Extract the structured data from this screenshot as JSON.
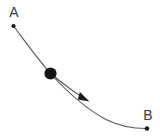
{
  "figure": {
    "name": "brachistochrone-curve-diagram",
    "width": 160,
    "height": 138,
    "background_color": "#ffffff"
  },
  "style": {
    "curve_color": "#555555",
    "curve_width": 1.1,
    "arrow_color": "#1a1a1a",
    "ball_color": "#141414",
    "dot_color": "#141414",
    "label_color": "#3a3a3a",
    "label_font_size": 14
  },
  "labels": [
    {
      "id": "label-a",
      "text": "A",
      "x": 14,
      "y": 17
    },
    {
      "id": "label-b",
      "text": "B",
      "x": 148,
      "y": 120
    }
  ],
  "endpoints": [
    {
      "id": "point-a",
      "label": "A",
      "x": 13.5,
      "y": 26,
      "radius": 2.1
    },
    {
      "id": "point-b",
      "label": "B",
      "x": 147,
      "y": 128.5,
      "radius": 2.2
    }
  ],
  "ball": {
    "id": "sliding-ball",
    "x": 50.5,
    "y": 73.5,
    "radius": 6.1
  },
  "paths": {
    "trajectory": "M 13.5 26 C 27 44 38.5 60 50.5 73.5 C 66 90.5 86 109 106 119.5 C 120 126.4 135 128.6 147 128.5",
    "motion_arrow": "M 55.5 77.5 C 63.5 84 71.5 90.4 81.5 96.6"
  },
  "arrow_head": {
    "id": "direction-arrowhead",
    "tip_x": 89.5,
    "tip_y": 101.5,
    "points": "89.5,101.5 77.8,99.6 79.9,92.0",
    "direction": "down-right"
  },
  "chart_data": {
    "type": "line",
    "xlabel": "",
    "ylabel": "",
    "xlim": [
      0,
      160
    ],
    "ylim": [
      138,
      0
    ],
    "grid": false,
    "legend_position": "none",
    "series": [
      {
        "name": "trajectory",
        "x": [
          13.5,
          50.5,
          106,
          147
        ],
        "y": [
          26,
          73.5,
          119.5,
          128.5
        ]
      },
      {
        "name": "motion-arrow",
        "x": [
          55.5,
          81.5,
          89.5
        ],
        "y": [
          77.5,
          96.6,
          101.5
        ]
      }
    ],
    "annotations": [
      {
        "text": "A",
        "x": 14,
        "y": 17
      },
      {
        "text": "B",
        "x": 148,
        "y": 120
      },
      {
        "text": "ball",
        "x": 50.5,
        "y": 73.5
      }
    ]
  }
}
